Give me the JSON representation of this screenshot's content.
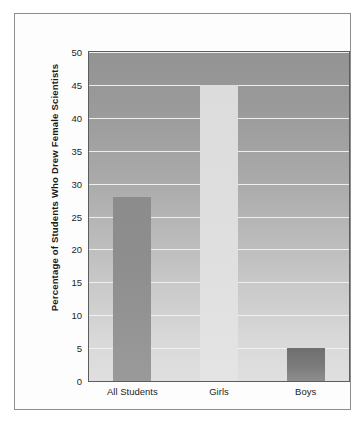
{
  "chart_data": {
    "type": "bar",
    "title": "",
    "subtitle": "",
    "xlabel": "",
    "ylabel": "Percentage of Students Who Drew Female Scientists",
    "categories": [
      "All Students",
      "Girls",
      "Boys"
    ],
    "values": [
      28,
      45,
      5
    ],
    "series": [
      {
        "name": "Percentage of Students Who Drew Female Scientists",
        "values": [
          28,
          45,
          5
        ]
      }
    ],
    "ylim": [
      0,
      50
    ],
    "ytick_labels": [
      "0",
      "5",
      "10",
      "15",
      "20",
      "25",
      "30",
      "35",
      "40",
      "45",
      "50"
    ],
    "ytick_values": [
      0,
      5,
      10,
      15,
      20,
      25,
      30,
      35,
      40,
      45,
      50
    ],
    "grid": true,
    "grid_axis": "y",
    "legend": false,
    "legend_position": "none",
    "annotations": [],
    "bar_colors": [
      "#8c8c8c",
      "#dcdcdc",
      "#6f6f6f"
    ],
    "plot_background": "#a9a9a9",
    "gridline_color": "#f2f2f2",
    "axis_color": "#5d5d5d",
    "frame_color": "#8d8d8d"
  }
}
